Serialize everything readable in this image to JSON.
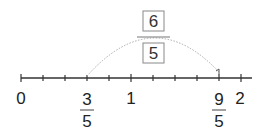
{
  "diagram": {
    "type": "number-line",
    "range": [
      0,
      2
    ],
    "subdivision": 5,
    "integer_labels": [
      "0",
      "1",
      "2"
    ],
    "fraction_labels": [
      {
        "numerator": "3",
        "denominator": "5"
      },
      {
        "numerator": "9",
        "denominator": "5"
      }
    ],
    "jump": {
      "from": "3/5",
      "to": "9/5",
      "numerator": "6",
      "denominator": "5"
    },
    "colors": {
      "axis": "#333333",
      "arc": "#aaaaaa",
      "box_border": "#888888"
    }
  }
}
